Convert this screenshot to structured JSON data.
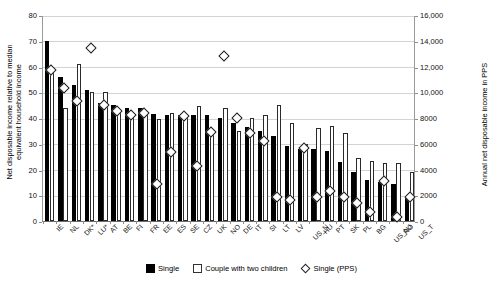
{
  "chart_data": {
    "type": "bar",
    "title": "",
    "subtitle": "",
    "xlabel": "",
    "ylabel": "Net disposable income relative to median equivalent household income",
    "y2label": "Annual net disposable income in PPS",
    "ylim": [
      0,
      80
    ],
    "y2lim": [
      0,
      16000
    ],
    "grid": true,
    "legend_position": "bottom-center",
    "y_ticks": [
      "0",
      "10",
      "20",
      "30",
      "40",
      "50",
      "60",
      "70",
      "80"
    ],
    "y_tick_values": [
      0,
      10,
      20,
      30,
      40,
      50,
      60,
      70,
      80
    ],
    "y2_ticks": [
      "0",
      "2000",
      "4000",
      "6000",
      "8000",
      "10,000",
      "12,000",
      "14,000",
      "16,000"
    ],
    "y2_tick_values": [
      0,
      2000,
      4000,
      6000,
      8000,
      10000,
      12000,
      14000,
      16000
    ],
    "categories": [
      "IE",
      "NL",
      "DK*",
      "LU*",
      "AT",
      "BE",
      "FI",
      "FR",
      "EE",
      "ES",
      "SE",
      "CZ",
      "UK",
      "NO",
      "DE",
      "IT",
      "SI",
      "LT",
      "LV",
      "US_N",
      "HU",
      "PT",
      "SK",
      "PL",
      "BG",
      "US_NJ",
      "RO",
      "US_T"
    ],
    "series": [
      {
        "name": "Single",
        "axis": "left",
        "style": "filled-black-bar",
        "values": [
          70,
          56,
          53,
          51,
          46,
          45,
          44,
          44,
          41.5,
          41,
          41,
          41,
          41,
          40,
          38,
          36.5,
          35,
          33,
          29,
          28,
          28,
          27,
          23,
          19,
          16,
          15,
          14.5,
          9
        ]
      },
      {
        "name": "Couple with two children",
        "axis": "left",
        "style": "open-white-bar",
        "values": [
          59.5,
          44,
          61,
          50,
          50,
          43.5,
          42,
          41,
          39.5,
          42,
          40,
          44.5,
          35.5,
          44,
          35,
          40,
          41,
          45,
          38,
          30,
          36,
          37,
          34,
          24.5,
          23.5,
          22.5,
          22.5,
          19
        ]
      },
      {
        "name": "Single (PPS)",
        "axis": "right",
        "style": "open-diamond-marker",
        "values": [
          11900,
          10500,
          9500,
          13600,
          9150,
          8700,
          8400,
          8550,
          3000,
          5550,
          8300,
          4450,
          7100,
          13000,
          8150,
          7000,
          6400,
          2050,
          1750,
          5800,
          2050,
          2500,
          2050,
          1550,
          850,
          3250,
          500,
          2000
        ]
      }
    ]
  },
  "legend": {
    "items": [
      {
        "label": "Single",
        "marker": "filled-square"
      },
      {
        "label": "Couple with two children",
        "marker": "open-square"
      },
      {
        "label": "Single (PPS)",
        "marker": "open-diamond"
      }
    ]
  }
}
